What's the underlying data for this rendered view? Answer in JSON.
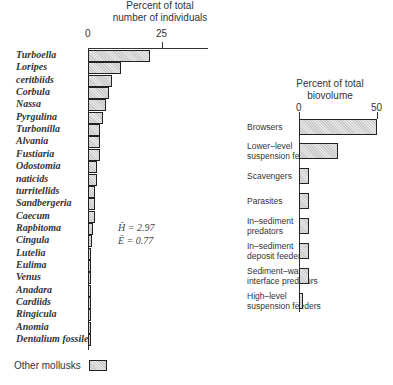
{
  "chart_data": [
    {
      "type": "bar",
      "orientation": "horizontal",
      "title": "Percent of total number of individuals",
      "title_lines": [
        "Percent of total",
        "number of individuals"
      ],
      "xlabel": "Percent of total number of individuals",
      "ylabel": "",
      "xlim": [
        0,
        40
      ],
      "ticks": [
        "0",
        "25"
      ],
      "categories": [
        "Turboella",
        "Loripes",
        "ceritbiids",
        "Corbula",
        "Nassa",
        "Pyrgulina",
        "Turbonilla",
        "Alvania",
        "Fustiaria",
        "Odostomia",
        "naticids",
        "turritellids",
        "Sandbergeria",
        "Caecum",
        "Rapbitoma",
        "Cingula",
        "Lutelia",
        "Eulima",
        "Venus",
        "Anadara",
        "Cardiids",
        "Ringicula",
        "Anomia",
        "Dentalium fossile",
        "Other mollusks"
      ],
      "values": [
        21,
        11,
        8,
        7,
        6,
        5,
        4,
        4,
        4,
        3,
        3,
        2.5,
        2.5,
        2.5,
        1.7,
        1.2,
        1,
        1,
        1,
        1,
        1,
        1,
        1,
        1,
        6
      ],
      "annotations": [
        "H̄ = 2.97",
        "Ē = 0.77"
      ]
    },
    {
      "type": "bar",
      "orientation": "horizontal",
      "title": "Percent of total biovolume",
      "title_lines": [
        "Percent of total",
        "biovolume"
      ],
      "xlabel": "Percent of total biovolume",
      "ylabel": "",
      "xlim": [
        0,
        50
      ],
      "ticks": [
        "0",
        "50"
      ],
      "categories": [
        "Browsers",
        "Lower-level suspension feeders",
        "Scavengers",
        "Parasites",
        "In-sediment predators",
        "In-sediment deposit feeders",
        "Sediment-water interface predators",
        "High-level suspension feeders"
      ],
      "category_lines": [
        [
          "Browsers"
        ],
        [
          "Lower–level",
          "suspension feeders"
        ],
        [
          "Scavengers"
        ],
        [
          "Parasites"
        ],
        [
          "In–sediment",
          "predators"
        ],
        [
          "In–sediment",
          "deposit feeders"
        ],
        [
          "Sediment–water",
          "interface predators"
        ],
        [
          "High–level",
          "suspension fėeders"
        ]
      ],
      "values": [
        50,
        25,
        6.5,
        6.5,
        6.5,
        6.5,
        6.5,
        2.5
      ]
    }
  ],
  "left": {
    "title1": "Percent of total",
    "title2": "number of individuals",
    "tick0": "0",
    "tick25": "25",
    "stat_h": "H̄  =  2.97",
    "stat_e": "Ē  =  0.77"
  },
  "right": {
    "title1": "Percent of total",
    "title2": "biovolume",
    "tick0": "0",
    "tick50": "50"
  }
}
